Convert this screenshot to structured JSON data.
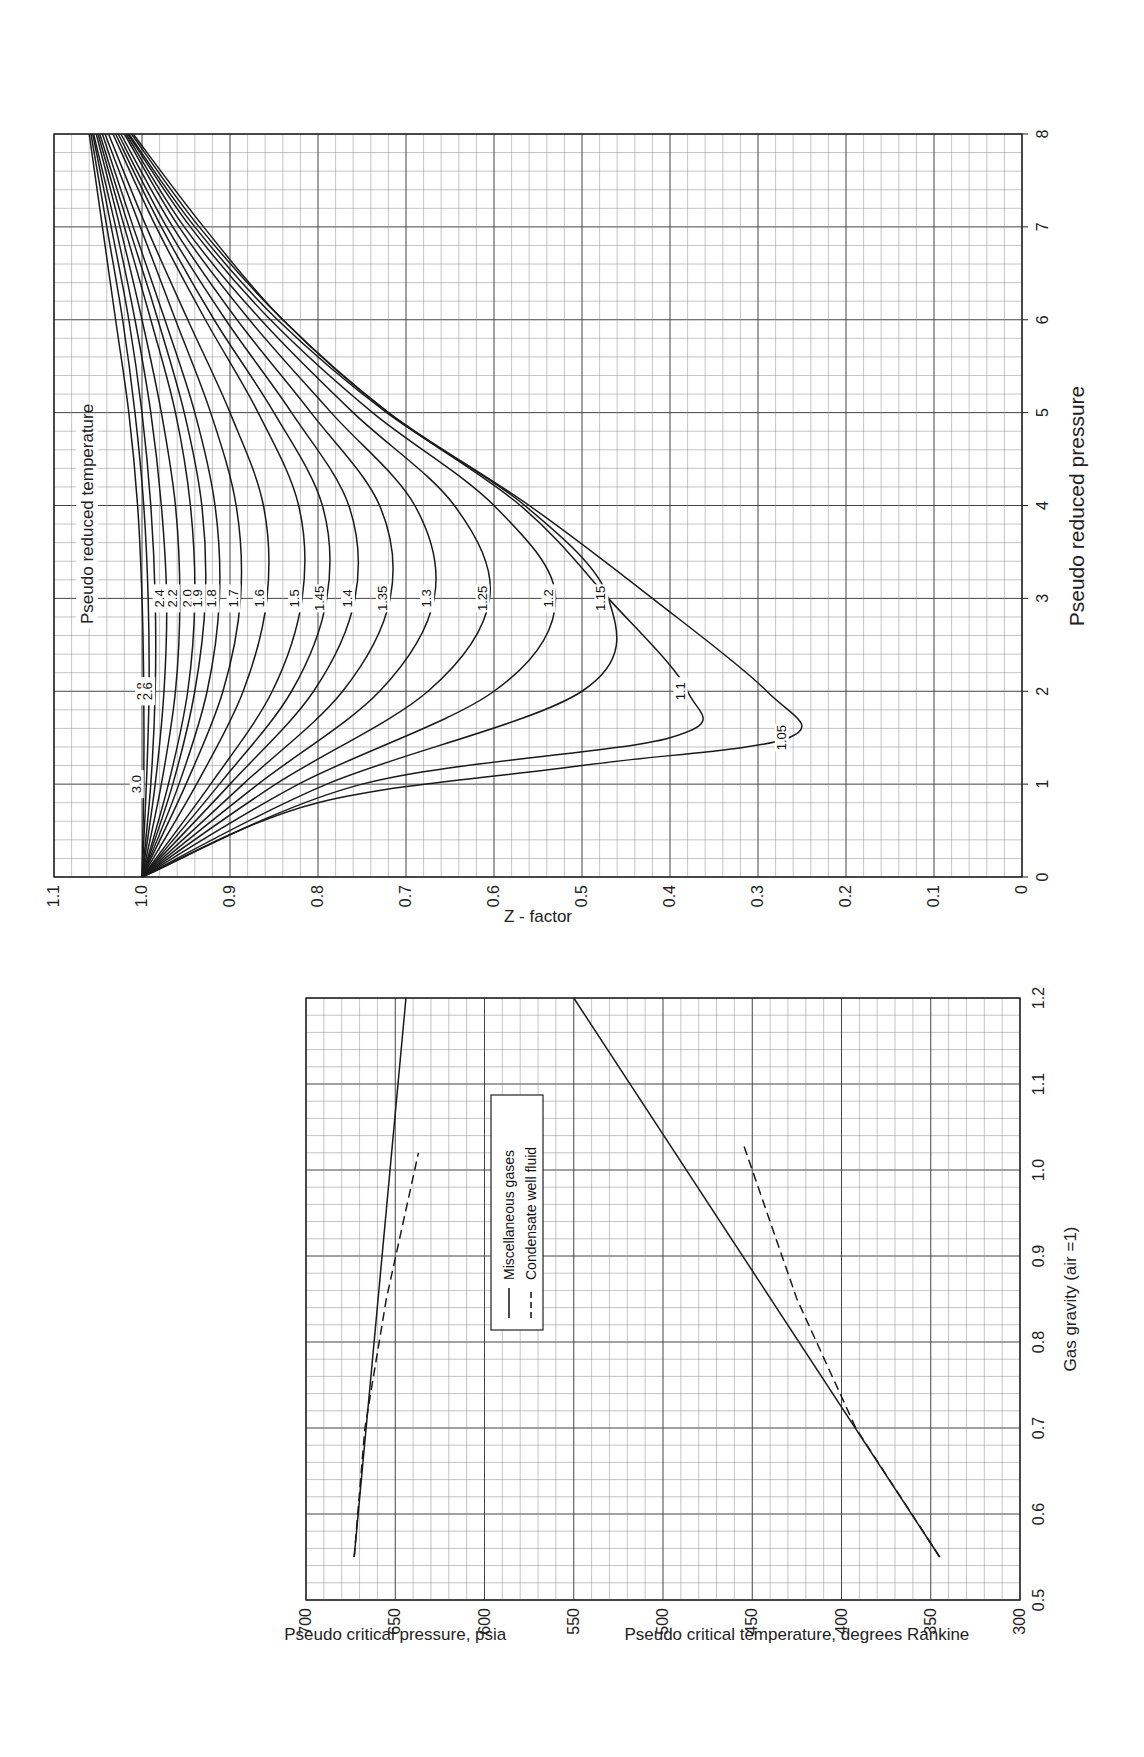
{
  "chart_data": [
    {
      "type": "line",
      "id": "z-factor-chart",
      "title": "",
      "annotation": "Pseudo reduced temperature",
      "xlabel": "Pseudo reduced pressure",
      "ylabel": "Z - factor",
      "xlim": [
        0,
        8
      ],
      "ylim": [
        0,
        1.1
      ],
      "x_ticks": [
        "0",
        "1",
        "2",
        "3",
        "4",
        "5",
        "6",
        "7",
        "8"
      ],
      "y_ticks": [
        "0",
        "0.1",
        "0.2",
        "0.3",
        "0.4",
        "0.5",
        "0.6",
        "0.7",
        "0.8",
        "0.9",
        "1.0",
        "1.1"
      ],
      "grid": true,
      "orientation": "rotated-90-ccw",
      "series": [
        {
          "name": "3.0",
          "x": [
            0,
            1,
            2,
            3,
            4,
            5,
            6,
            7,
            8
          ],
          "y": [
            1.0,
            0.998,
            0.998,
            1.0,
            1.005,
            1.015,
            1.03,
            1.045,
            1.06
          ]
        },
        {
          "name": "2.8",
          "x": [
            0,
            1,
            2,
            3,
            4,
            5,
            6,
            7,
            8
          ],
          "y": [
            1.0,
            0.995,
            0.992,
            0.993,
            0.998,
            1.008,
            1.022,
            1.04,
            1.058
          ]
        },
        {
          "name": "2.6",
          "x": [
            0,
            1,
            2,
            3,
            4,
            5,
            6,
            7,
            8
          ],
          "y": [
            1.0,
            0.99,
            0.985,
            0.985,
            0.99,
            1.0,
            1.015,
            1.035,
            1.056
          ]
        },
        {
          "name": "2.4",
          "x": [
            0,
            1,
            2,
            3,
            4,
            5,
            6,
            7,
            8
          ],
          "y": [
            1.0,
            0.985,
            0.975,
            0.972,
            0.978,
            0.99,
            1.008,
            1.03,
            1.055
          ]
        },
        {
          "name": "2.2",
          "x": [
            0,
            1,
            2,
            3,
            4,
            5,
            6,
            7,
            8
          ],
          "y": [
            1.0,
            0.978,
            0.962,
            0.957,
            0.962,
            0.978,
            1.0,
            1.025,
            1.052
          ]
        },
        {
          "name": "2.0",
          "x": [
            0,
            1,
            2,
            3,
            4,
            5,
            6,
            7,
            8
          ],
          "y": [
            1.0,
            0.97,
            0.948,
            0.94,
            0.945,
            0.962,
            0.99,
            1.02,
            1.05
          ]
        },
        {
          "name": "1.9",
          "x": [
            0,
            1,
            2,
            3,
            4,
            5,
            6,
            7,
            8
          ],
          "y": [
            1.0,
            0.965,
            0.94,
            0.928,
            0.932,
            0.952,
            0.982,
            1.015,
            1.048
          ]
        },
        {
          "name": "1.8",
          "x": [
            0,
            1,
            2,
            3,
            4,
            5,
            6,
            7,
            8
          ],
          "y": [
            1.0,
            0.958,
            0.926,
            0.912,
            0.917,
            0.94,
            0.974,
            1.01,
            1.045
          ]
        },
        {
          "name": "1.7",
          "x": [
            0,
            1,
            2,
            3,
            4,
            5,
            6,
            7,
            8
          ],
          "y": [
            1.0,
            0.95,
            0.908,
            0.888,
            0.893,
            0.922,
            0.962,
            1.002,
            1.042
          ]
        },
        {
          "name": "1.6",
          "x": [
            0,
            1,
            2,
            3,
            4,
            5,
            6,
            7,
            8
          ],
          "y": [
            1.0,
            0.938,
            0.885,
            0.858,
            0.862,
            0.9,
            0.948,
            0.995,
            1.038
          ]
        },
        {
          "name": "1.5",
          "x": [
            0,
            1,
            2,
            3,
            4,
            5,
            6,
            7,
            8
          ],
          "y": [
            1.0,
            0.922,
            0.852,
            0.818,
            0.822,
            0.868,
            0.928,
            0.984,
            1.033
          ]
        },
        {
          "name": "1.45",
          "x": [
            0,
            1,
            2,
            3,
            4,
            5,
            6,
            7,
            8
          ],
          "y": [
            1.0,
            0.912,
            0.83,
            0.79,
            0.795,
            0.85,
            0.918,
            0.978,
            1.03
          ]
        },
        {
          "name": "1.4",
          "x": [
            0,
            1,
            2,
            3,
            4,
            5,
            6,
            7,
            8
          ],
          "y": [
            1.0,
            0.9,
            0.805,
            0.758,
            0.765,
            0.83,
            0.905,
            0.972,
            1.027
          ]
        },
        {
          "name": "1.35",
          "x": [
            0,
            1,
            2,
            3,
            4,
            5,
            6,
            7,
            8
          ],
          "y": [
            1.0,
            0.885,
            0.772,
            0.718,
            0.73,
            0.808,
            0.892,
            0.965,
            1.024
          ]
        },
        {
          "name": "1.3",
          "x": [
            0,
            1,
            2,
            3,
            4,
            5,
            6,
            7,
            8
          ],
          "y": [
            1.0,
            0.868,
            0.73,
            0.668,
            0.69,
            0.785,
            0.878,
            0.958,
            1.02
          ]
        },
        {
          "name": "1.25",
          "x": [
            0,
            1,
            2,
            3,
            4,
            5,
            6,
            7,
            8
          ],
          "y": [
            1.0,
            0.848,
            0.675,
            0.605,
            0.645,
            0.76,
            0.865,
            0.952,
            1.018
          ]
        },
        {
          "name": "1.2",
          "x": [
            0,
            1,
            2,
            3,
            4,
            5,
            6,
            7,
            8
          ],
          "y": [
            1.0,
            0.822,
            0.6,
            0.53,
            0.6,
            0.738,
            0.854,
            0.945,
            1.016
          ]
        },
        {
          "name": "1.15",
          "x": [
            0,
            1,
            2,
            3,
            4,
            5,
            6,
            7,
            8
          ],
          "y": [
            1.0,
            0.79,
            0.5,
            0.47,
            0.565,
            0.722,
            0.846,
            0.94,
            1.015
          ]
        },
        {
          "name": "1.1",
          "x": [
            0,
            1,
            1.5,
            2,
            3,
            4,
            5,
            6,
            7,
            8
          ],
          "y": [
            1.0,
            0.75,
            0.4,
            0.38,
            0.47,
            0.57,
            0.72,
            0.84,
            0.935,
            1.012
          ]
        },
        {
          "name": "1.05",
          "x": [
            0,
            0.8,
            1.2,
            1.5,
            2,
            3,
            4,
            5,
            6,
            7,
            8
          ],
          "y": [
            1.0,
            0.8,
            0.5,
            0.265,
            0.29,
            0.42,
            0.56,
            0.72,
            0.84,
            0.93,
            1.01
          ]
        }
      ]
    },
    {
      "type": "line",
      "id": "pseudo-critical-chart",
      "title": "",
      "xlabel": "Gas gravity (air =1)",
      "ylabel_left": "Pseudo critical pressure, psia",
      "ylabel_right": "Pseudo critical temperature, degrees Rankine",
      "xlim": [
        0.5,
        1.2
      ],
      "ylim": [
        300,
        700
      ],
      "x_ticks": [
        "0.5",
        "0.6",
        "0.7",
        "0.8",
        "0.9",
        "1.0",
        "1.1",
        "1.2"
      ],
      "y_ticks": [
        "300",
        "350",
        "400",
        "450",
        "500",
        "550",
        "600",
        "650",
        "700"
      ],
      "grid": true,
      "orientation": "rotated-90-ccw",
      "legend": {
        "placement": "upper-middle",
        "entries": [
          {
            "label": "Miscellaneous gases",
            "style": "solid"
          },
          {
            "label": "Condensate well fluid",
            "style": "dashed"
          }
        ]
      },
      "series": [
        {
          "name": "Pseudo critical pressure - Miscellaneous gases",
          "style": "solid",
          "x": [
            0.55,
            1.2
          ],
          "y": [
            673,
            644
          ]
        },
        {
          "name": "Pseudo critical pressure - Condensate well fluid",
          "style": "dashed",
          "x": [
            0.55,
            0.7,
            0.85,
            1.02
          ],
          "y": [
            673,
            667,
            655,
            637
          ]
        },
        {
          "name": "Pseudo critical temperature - Miscellaneous gases",
          "style": "solid",
          "x": [
            0.55,
            1.2
          ],
          "y": [
            345,
            550
          ]
        },
        {
          "name": "Pseudo critical temperature - Condensate well fluid",
          "style": "dashed",
          "x": [
            0.55,
            0.7,
            0.85,
            1.03
          ],
          "y": [
            345,
            392,
            425,
            455
          ]
        }
      ]
    }
  ]
}
